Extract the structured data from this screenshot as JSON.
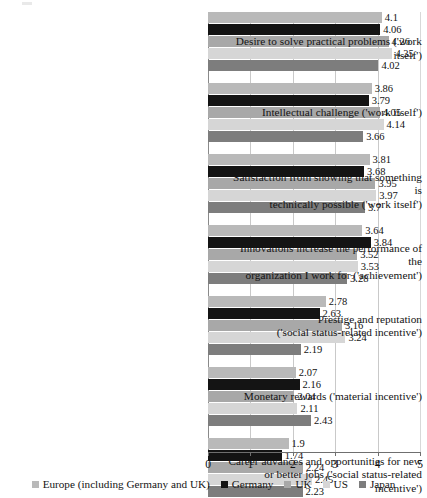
{
  "chart_data": {
    "type": "bar",
    "orientation": "horizontal",
    "title": "",
    "subtitle": "",
    "xlabel": "",
    "ylabel": "",
    "xlim": [
      0,
      5
    ],
    "x_ticks": [
      0,
      1,
      2,
      3,
      4,
      5
    ],
    "x_tick_labels": [
      "0",
      "1",
      "2",
      "3",
      "4",
      "5"
    ],
    "grid": true,
    "grid_axis": "x",
    "legend_position": "bottom",
    "value_labels": true,
    "categories": [
      "Desire to solve practical problems ('work itself')",
      "Intellectual challenge ('work itself')",
      "Satisfaction from showing that something is technically possible ('work itself')",
      "Innovations increase the performance of the organization I work for ('achievement')",
      "Prestige and reputation ('social status-related incentive')",
      "Monetary rewards ('material incentive')",
      "Career advances and opportunities for new or better jobs ('social status-related incentive')"
    ],
    "category_lines": [
      [
        "Desire to solve practical problems ('work itself')"
      ],
      [
        "Intellectual challenge ('work itself')"
      ],
      [
        "Satisfaction from showing that something is",
        "technically possible ('work itself')"
      ],
      [
        "Innovations increase the performance of the",
        "organization I work for ('achievement')"
      ],
      [
        "Prestige and reputation",
        "('social status-related incentive')"
      ],
      [
        "Monetary rewards ('material incentive')"
      ],
      [
        "Career advances and opportunities for new",
        "or better jobs ('social status-related incentive')"
      ]
    ],
    "series": [
      {
        "name": "Europe (including Germany and UK)",
        "color": "#b9b9b9",
        "values": [
          4.1,
          3.86,
          3.81,
          3.64,
          2.78,
          2.07,
          1.9
        ],
        "labels": [
          "4.1",
          "3.86",
          "3.81",
          "3.64",
          "2.78",
          "2.07",
          "1.9"
        ]
      },
      {
        "name": "Germany",
        "color": "#141414",
        "values": [
          4.06,
          3.79,
          3.68,
          3.84,
          2.63,
          2.16,
          1.74
        ],
        "labels": [
          "4.06",
          "3.79",
          "3.68",
          "3.84",
          "2.63",
          "2.16",
          "1.74"
        ]
      },
      {
        "name": "UK",
        "color": "#a8a8a8",
        "values": [
          4.26,
          4.05,
          3.95,
          3.52,
          3.16,
          2.04,
          2.24
        ],
        "labels": [
          "4.26",
          "4.05",
          "3.95",
          "3.52",
          "3.16",
          "2.04",
          "2.24"
        ]
      },
      {
        "name": "US",
        "color": "#d6d6d6",
        "values": [
          4.35,
          4.14,
          3.97,
          3.53,
          3.24,
          2.11,
          2.45
        ],
        "labels": [
          "4.35",
          "4.14",
          "3.97",
          "3.53",
          "3.24",
          "2.11",
          "2.45"
        ]
      },
      {
        "name": "Japan",
        "color": "#7d7d7d",
        "values": [
          4.02,
          3.66,
          3.7,
          3.28,
          2.19,
          2.43,
          2.23
        ],
        "labels": [
          "4.02",
          "3.66",
          "3.7",
          "3.28",
          "2.19",
          "2.43",
          "2.23"
        ]
      }
    ]
  },
  "legend": {
    "items": [
      {
        "label": "Europe (including Germany and UK)",
        "color": "#b9b9b9"
      },
      {
        "label": "Germany",
        "color": "#141414"
      },
      {
        "label": "UK",
        "color": "#a8a8a8"
      },
      {
        "label": "US",
        "color": "#d6d6d6"
      },
      {
        "label": "Japan",
        "color": "#7d7d7d"
      }
    ]
  },
  "axis": {
    "tick_labels": [
      "0",
      "1",
      "2",
      "3",
      "4",
      "5"
    ]
  }
}
